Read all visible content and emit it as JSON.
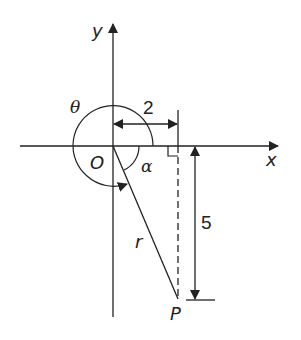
{
  "diagram": {
    "type": "polar-coordinate-diagram",
    "axes": {
      "x_label": "x",
      "y_label": "y",
      "origin_label": "O"
    },
    "angles": {
      "theta_label": "θ",
      "alpha_label": "α"
    },
    "point": {
      "label": "P",
      "radius_label": "r"
    },
    "dimensions": {
      "horizontal": "2",
      "vertical": "5"
    },
    "colors": {
      "stroke": "#222222",
      "background": "#ffffff"
    }
  }
}
